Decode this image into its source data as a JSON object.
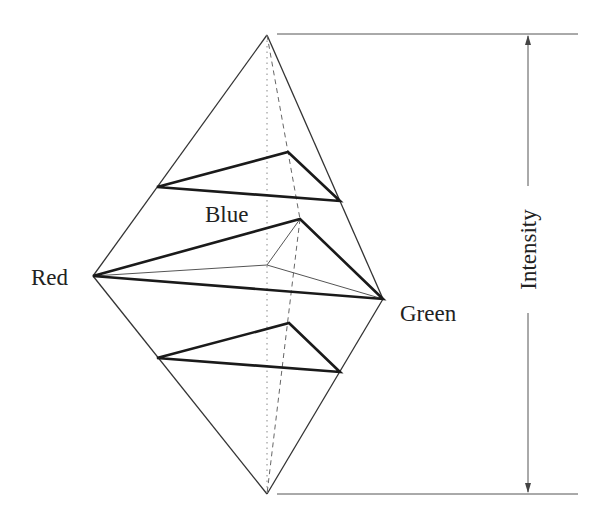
{
  "diagram": {
    "labels": {
      "red": "Red",
      "green": "Green",
      "blue": "Blue",
      "axis": "Intensity"
    },
    "colors": {
      "stroke": "#222222",
      "thin_stroke": "#444444",
      "guide": "#666666",
      "background": "#ffffff"
    },
    "vertices": {
      "apex_top": [
        267,
        35
      ],
      "apex_bottom": [
        267,
        494
      ],
      "red": [
        93,
        276
      ],
      "green": [
        383,
        299
      ],
      "blue_mid": [
        300,
        219
      ],
      "center": [
        267,
        265
      ]
    },
    "cross_sections": [
      {
        "name": "upper",
        "left": [
          157,
          187
        ],
        "back": [
          288,
          152
        ],
        "right": [
          340,
          201
        ]
      },
      {
        "name": "middle",
        "left": [
          93,
          276
        ],
        "back": [
          300,
          219
        ],
        "right": [
          383,
          299
        ]
      },
      {
        "name": "lower",
        "left": [
          157,
          358
        ],
        "back": [
          289,
          323
        ],
        "right": [
          340,
          372
        ]
      }
    ],
    "intensity_axis": {
      "x": 528,
      "top": 34,
      "bottom": 494,
      "tick_left": 277,
      "tick_right": 578
    }
  }
}
